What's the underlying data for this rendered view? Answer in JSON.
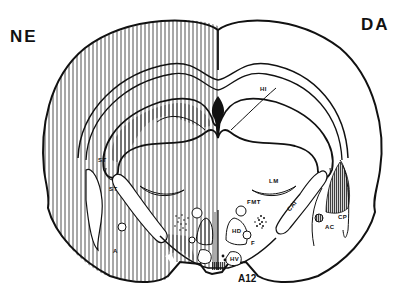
{
  "figure": {
    "hemispheres": {
      "left": "NE",
      "right": "DA"
    },
    "labels": {
      "hi": "HI",
      "st_upper": "ST",
      "st_lower": "ST",
      "lm": "LM",
      "fmt": "FMT",
      "ca1": "CAI",
      "cp": "CP",
      "ac": "AC",
      "hd": "HD",
      "f": "F",
      "hv": "HV",
      "a12": "A12",
      "a_small": "A"
    },
    "colors": {
      "stroke": "#111111",
      "background": "#ffffff",
      "hatch": "#222222"
    }
  }
}
